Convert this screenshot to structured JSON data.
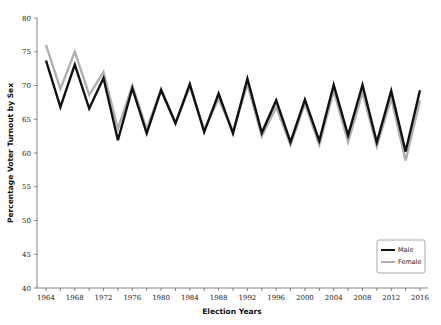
{
  "chart_data": {
    "type": "line",
    "title": "",
    "xlabel": "Election Years",
    "ylabel": "Percentage Voter Turnout by Sex",
    "ylim": [
      40,
      80
    ],
    "xlim": [
      1964,
      2016
    ],
    "yticks": [
      40,
      45,
      50,
      55,
      60,
      65,
      70,
      75,
      80
    ],
    "xtick_labels": [
      1964,
      1968,
      1972,
      1976,
      1980,
      1984,
      1988,
      1992,
      1996,
      2000,
      2004,
      2008,
      2012,
      2016
    ],
    "minor_xtick_step": 2,
    "grid": false,
    "legend_position": "lower right",
    "x": [
      1964,
      1966,
      1968,
      1970,
      1972,
      1974,
      1976,
      1978,
      1980,
      1982,
      1984,
      1986,
      1988,
      1990,
      1992,
      1994,
      1996,
      1998,
      2000,
      2002,
      2004,
      2006,
      2008,
      2010,
      2012,
      2014,
      2016
    ],
    "series": [
      {
        "name": "Male",
        "color": "#111111",
        "values": [
          73.7,
          66.8,
          73.1,
          66.6,
          71.1,
          61.9,
          69.6,
          62.9,
          69.3,
          64.4,
          70.2,
          63.1,
          68.8,
          62.9,
          71.0,
          63.0,
          67.8,
          61.6,
          67.9,
          61.8,
          70.1,
          62.6,
          70.1,
          61.6,
          69.2,
          60.2,
          69.3
        ]
      },
      {
        "name": "Female",
        "color": "#b0b0b0",
        "values": [
          76.0,
          69.5,
          75.0,
          68.6,
          72.0,
          63.6,
          70.0,
          63.5,
          69.5,
          64.4,
          69.8,
          63.5,
          68.0,
          63.2,
          70.2,
          62.5,
          66.8,
          61.2,
          67.3,
          61.2,
          69.2,
          61.6,
          69.0,
          61.0,
          68.1,
          58.9,
          67.8
        ]
      }
    ]
  }
}
